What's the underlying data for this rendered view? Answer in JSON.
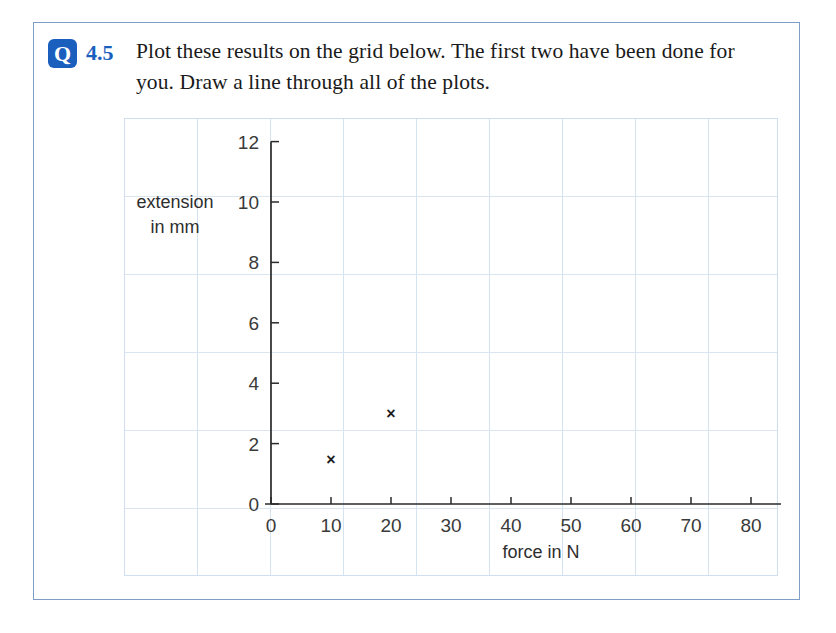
{
  "page": {
    "background": "#ffffff",
    "frame_color": "#7d9cc8"
  },
  "question": {
    "badge_letter": "Q",
    "number": "4.5",
    "text": "Plot these results on the grid below. The first two have been done for you. Draw a line through all of the plots.",
    "accent_color": "#1b5fbe"
  },
  "chart_data": {
    "type": "scatter",
    "title": "",
    "xlabel": "force in N",
    "ylabel": "extension in mm",
    "ylabel_line1": "extension",
    "ylabel_line2": "in mm",
    "x": [
      10,
      20
    ],
    "y": [
      1.5,
      3
    ],
    "points": [
      {
        "x": 10,
        "y": 1.5,
        "marker": "x"
      },
      {
        "x": 20,
        "y": 3,
        "marker": "x"
      }
    ],
    "xlim": [
      0,
      85
    ],
    "ylim": [
      0,
      12
    ],
    "xticks": [
      0,
      10,
      20,
      30,
      40,
      50,
      60,
      70,
      80
    ],
    "yticks": [
      0,
      2,
      4,
      6,
      8,
      10,
      12
    ],
    "xticklabels": [
      "0",
      "10",
      "20",
      "30",
      "40",
      "50",
      "60",
      "70",
      "80"
    ],
    "yticklabels": [
      "0",
      "2",
      "4",
      "6",
      "8",
      "10",
      "12"
    ],
    "grid": true,
    "grid_color": "#d5e3f0",
    "legend": null,
    "marker_color": "#1c1c1c",
    "axis_color": "#2a2a2a"
  },
  "grid_paper": {
    "v_count": 9,
    "v_spacing": 73,
    "h_count": 6,
    "h_spacing": 78
  }
}
